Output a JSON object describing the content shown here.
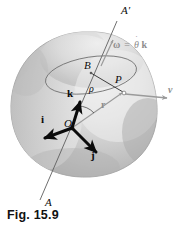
{
  "figure": {
    "caption": "Fig. 15.9",
    "background_color": "#ffffff",
    "body_fill_light": "#e6e6e6",
    "body_fill_mid": "#c9c9c9",
    "body_fill_dark": "#a8a8a8",
    "body_outline": "#9a9a9a",
    "ink_color": "#0b0b0b",
    "gray_color": "#8d8d8d"
  },
  "labels": {
    "axis_top": "A′",
    "axis_bottom": "A",
    "origin": "O",
    "point_b": "B",
    "point_p": "P",
    "unit_i": "i",
    "unit_j": "j",
    "unit_k": "k",
    "radius_rho": "ρ",
    "position_r": "r",
    "velocity_v": "v",
    "angular_velocity_omega": "ω",
    "angular_velocity_equals": "=",
    "angular_velocity_theta": "θ",
    "angular_velocity_dot": "˙",
    "angular_velocity_k": "k"
  },
  "geometry": {
    "axis_line_top_x": 116,
    "axis_line_top_y": 22,
    "axis_line_bottom_x": 40,
    "axis_line_bottom_y": 200,
    "origin_x": 72,
    "origin_y": 128,
    "point_b_x": 90,
    "point_b_y": 72,
    "point_p_x": 124,
    "point_p_y": 93,
    "ellipse_cx": 91,
    "ellipse_cy": 75,
    "ellipse_rx": 46,
    "ellipse_ry": 18,
    "ellipse_rotation_deg": -9,
    "vector_i_tip_x": 45,
    "vector_i_tip_y": 138,
    "vector_j_tip_x": 96,
    "vector_j_tip_y": 153,
    "vector_k_tip_x": 80,
    "vector_k_tip_y": 101,
    "vector_v_tip_x": 166,
    "vector_v_tip_y": 98
  },
  "label_positions": {
    "axis_top": {
      "x": 122,
      "y": 8,
      "size": 11
    },
    "axis_bottom": {
      "x": 44,
      "y": 199,
      "size": 11
    },
    "origin": {
      "x": 67,
      "y": 119,
      "size": 11
    },
    "point_b": {
      "x": 86,
      "y": 63,
      "size": 11
    },
    "point_p": {
      "x": 117,
      "y": 76,
      "size": 11
    },
    "unit_i": {
      "x": 43,
      "y": 122,
      "size": 11
    },
    "unit_j": {
      "x": 91,
      "y": 154,
      "size": 11
    },
    "unit_k": {
      "x": 69,
      "y": 95,
      "size": 11
    },
    "radius_rho": {
      "x": 91,
      "y": 89,
      "size": 10
    },
    "position_r": {
      "x": 103,
      "y": 104,
      "size": 10
    },
    "velocity_v": {
      "x": 170,
      "y": 88,
      "size": 10
    },
    "omega_expr": {
      "x": 114,
      "y": 44,
      "size": 10
    }
  }
}
